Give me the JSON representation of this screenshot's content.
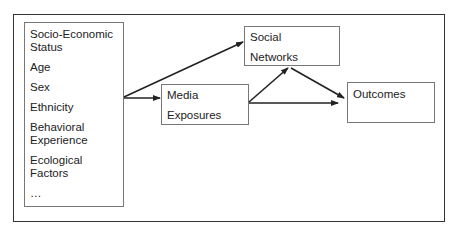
{
  "diagram": {
    "factors_box": {
      "items": [
        "Socio-Economic Status",
        "Age",
        "Sex",
        "Ethnicity",
        "Behavioral Experience",
        "Ecological Factors",
        "…"
      ],
      "lines": [
        [
          "Socio-Economic",
          "Status"
        ],
        [
          "Age"
        ],
        [
          "Sex"
        ],
        [
          "Ethnicity"
        ],
        [
          "Behavioral",
          "Experience"
        ],
        [
          "Ecological",
          "Factors"
        ],
        [
          "…"
        ]
      ]
    },
    "media_box": {
      "line1": "Media",
      "line2": "Exposures"
    },
    "social_box": {
      "line1": "Social",
      "line2": "Networks"
    },
    "outcomes_box": {
      "label": "Outcomes"
    },
    "edges": [
      {
        "from": "Factors",
        "to": "Media Exposures"
      },
      {
        "from": "Factors",
        "to": "Social Networks"
      },
      {
        "from": "Media Exposures",
        "to": "Social Networks"
      },
      {
        "from": "Social Networks",
        "to": "Outcomes"
      },
      {
        "from": "Media Exposures",
        "to": "Outcomes"
      }
    ]
  }
}
